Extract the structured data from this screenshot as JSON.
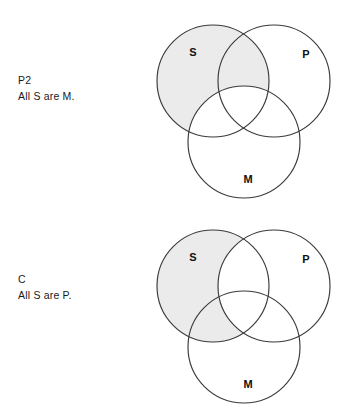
{
  "figure": {
    "type": "venn-syllogism-figure",
    "background_color": "#ffffff",
    "shade_color": "#ebebeb",
    "outline_color": "#3a3a3a"
  },
  "panels": [
    {
      "id": "panel-p2",
      "caption_label": "P2",
      "caption_text": "All S are M.",
      "shaded_region": "S minus M",
      "circles": [
        {
          "name": "S",
          "label": "S",
          "cx": 63,
          "cy": 69,
          "r": 56,
          "label_x": 43,
          "label_y": 41
        },
        {
          "name": "P",
          "label": "P",
          "cx": 124,
          "cy": 69,
          "r": 56,
          "label_x": 156,
          "label_y": 43
        },
        {
          "name": "M",
          "label": "M",
          "cx": 94,
          "cy": 130,
          "r": 56,
          "label_x": 98,
          "label_y": 168
        }
      ]
    },
    {
      "id": "panel-c",
      "caption_label": "C",
      "caption_text": "All S are P.",
      "shaded_region": "S minus P",
      "circles": [
        {
          "name": "S",
          "label": "S",
          "cx": 63,
          "cy": 69,
          "r": 56,
          "label_x": 43,
          "label_y": 41
        },
        {
          "name": "P",
          "label": "P",
          "cx": 124,
          "cy": 69,
          "r": 56,
          "label_x": 156,
          "label_y": 43
        },
        {
          "name": "M",
          "label": "M",
          "cx": 94,
          "cy": 130,
          "r": 56,
          "label_x": 98,
          "label_y": 168
        }
      ]
    }
  ]
}
